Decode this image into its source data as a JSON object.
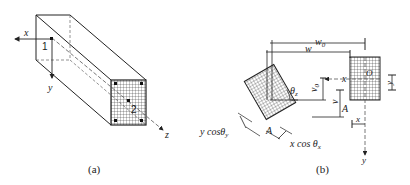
{
  "figure_a": {
    "caption": "(a)",
    "axis_x": "x",
    "axis_y": "y",
    "axis_z": "z",
    "point_1": "1",
    "point_2": "2"
  },
  "figure_b": {
    "caption": "(b)",
    "dim_w0": "w",
    "dim_w0_sub": "0",
    "dim_w": "w",
    "dim_v0": "v",
    "dim_v0_sub": "0",
    "dim_v": "v",
    "label_x_axis": "x",
    "label_y_axis": "y",
    "label_O": "O",
    "label_A_right": "A",
    "label_A_left": "A",
    "label_x_small": "x",
    "label_y_small": "y",
    "label_theta": "θ",
    "label_theta_sub": "z",
    "label_ycos": "y cosθ",
    "label_ycos_sub": "y",
    "label_xcos": "x cos θ",
    "label_xcos_sub": "x"
  },
  "colors": {
    "line": "#222222",
    "dashed": "#555555",
    "background": "#ffffff"
  }
}
